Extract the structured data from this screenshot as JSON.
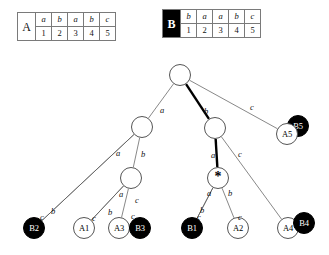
{
  "figure": {
    "type": "suffix-tree-diagram",
    "background": "#ffffff",
    "line_color": "#555555",
    "highlight_color": "#000000"
  },
  "tables": [
    {
      "id": "table-a",
      "name": "A",
      "inverted": false,
      "symbols": [
        "a",
        "b",
        "a",
        "b",
        "c"
      ],
      "indices": [
        "1",
        "2",
        "3",
        "4",
        "5"
      ]
    },
    {
      "id": "table-b",
      "name": "B",
      "inverted": true,
      "symbols": [
        "b",
        "a",
        "a",
        "b",
        "c"
      ],
      "indices": [
        "1",
        "2",
        "3",
        "4",
        "5"
      ]
    }
  ],
  "tree": {
    "nodes": [
      {
        "id": "root",
        "label": "",
        "kind": "internal",
        "x": 180,
        "y": 75
      },
      {
        "id": "n-a",
        "label": "",
        "kind": "internal",
        "x": 142,
        "y": 127
      },
      {
        "id": "n-b",
        "label": "",
        "kind": "internal",
        "x": 215,
        "y": 128
      },
      {
        "id": "n-ab",
        "label": "",
        "kind": "internal",
        "x": 131,
        "y": 178
      },
      {
        "id": "n-ba",
        "label": "*",
        "kind": "star",
        "x": 218,
        "y": 178
      },
      {
        "id": "B5",
        "label": "B5",
        "kind": "leaf-filled",
        "x": 298,
        "y": 126
      },
      {
        "id": "A5",
        "label": "A5",
        "kind": "leaf-open",
        "x": 287,
        "y": 134
      },
      {
        "id": "B2",
        "label": "B2",
        "kind": "leaf-filled",
        "x": 34,
        "y": 228
      },
      {
        "id": "A1",
        "label": "A1",
        "kind": "leaf-open",
        "x": 84,
        "y": 228
      },
      {
        "id": "A3",
        "label": "A3",
        "kind": "leaf-open",
        "x": 119,
        "y": 228
      },
      {
        "id": "B3",
        "label": "B3",
        "kind": "leaf-filled",
        "x": 140,
        "y": 228
      },
      {
        "id": "B1",
        "label": "B1",
        "kind": "leaf-filled",
        "x": 192,
        "y": 228
      },
      {
        "id": "A2",
        "label": "A2",
        "kind": "leaf-open",
        "x": 238,
        "y": 228
      },
      {
        "id": "A4",
        "label": "A4",
        "kind": "leaf-open",
        "x": 288,
        "y": 228
      },
      {
        "id": "B4",
        "label": "B4",
        "kind": "leaf-filled",
        "x": 304,
        "y": 223
      }
    ],
    "edges": [
      {
        "from": "root",
        "to": "n-a",
        "label": "a",
        "lx": 160,
        "ly": 106,
        "bold": false
      },
      {
        "from": "root",
        "to": "n-b",
        "label": "b",
        "lx": 204,
        "ly": 107,
        "bold": true
      },
      {
        "from": "root",
        "to": "A5",
        "label": "c",
        "lx": 250,
        "ly": 103,
        "bold": false
      },
      {
        "from": "n-a",
        "to": "B2",
        "label": "a",
        "lx": 116,
        "ly": 149,
        "bold": false
      },
      {
        "from": "n-a",
        "to": "n-ab",
        "label": "b",
        "lx": 141,
        "ly": 150,
        "bold": false
      },
      {
        "from": "n-b",
        "to": "n-ba",
        "label": "a",
        "lx": 211,
        "ly": 151,
        "bold": true
      },
      {
        "from": "n-b",
        "to": "A4",
        "label": "c",
        "lx": 238,
        "ly": 150,
        "bold": false
      },
      {
        "from": "n-ab",
        "to": "A1",
        "label": "a",
        "lx": 119,
        "ly": 190,
        "bold": false
      },
      {
        "from": "n-ab",
        "to": "A3",
        "label": "c",
        "lx": 135,
        "ly": 196,
        "bold": false
      },
      {
        "from": "n-ba",
        "to": "B1",
        "label": "a",
        "lx": 207,
        "ly": 189,
        "bold": false
      },
      {
        "from": "n-ba",
        "to": "A2",
        "label": "b",
        "lx": 228,
        "ly": 189,
        "bold": false
      },
      {
        "from": "n-a",
        "to": "B2",
        "label": "b",
        "lx": 51,
        "ly": 207,
        "bold": false
      },
      {
        "from": "n-ab",
        "to": "A1",
        "label": "b",
        "lx": 108,
        "ly": 208,
        "bold": false
      },
      {
        "from": "n-ba",
        "to": "B1",
        "label": "b",
        "lx": 200,
        "ly": 206,
        "bold": false
      },
      {
        "from": "leaf",
        "to": "B2",
        "label": "c",
        "lx": 40,
        "ly": 213,
        "bold": false
      },
      {
        "from": "leaf",
        "to": "A1",
        "label": "c",
        "lx": 92,
        "ly": 214,
        "bold": false
      },
      {
        "from": "leaf",
        "to": "A3",
        "label": "c",
        "lx": 131,
        "ly": 212,
        "bold": false
      },
      {
        "from": "leaf",
        "to": "B1",
        "label": "c",
        "lx": 197,
        "ly": 213,
        "bold": false
      },
      {
        "from": "leaf",
        "to": "A2",
        "label": "c",
        "lx": 238,
        "ly": 213,
        "bold": false
      }
    ]
  }
}
